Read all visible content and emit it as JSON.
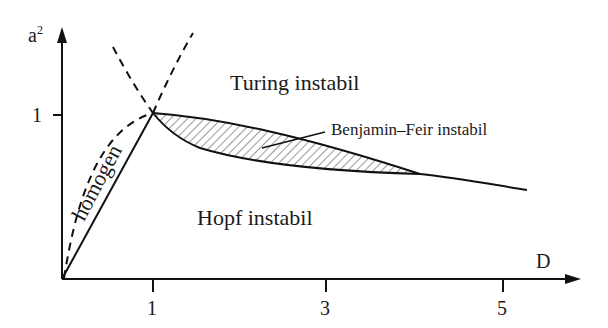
{
  "axes": {
    "y_label": "a",
    "y_label_sup": "2",
    "x_label": "D",
    "y_ticks": [
      "1"
    ],
    "x_ticks": [
      "1",
      "3",
      "5"
    ]
  },
  "regions": {
    "turing": "Turing instabil",
    "hopf": "Hopf instabil",
    "homogen": "homogen",
    "benjamin_feir": "Benjamin–Feir instabil"
  }
}
